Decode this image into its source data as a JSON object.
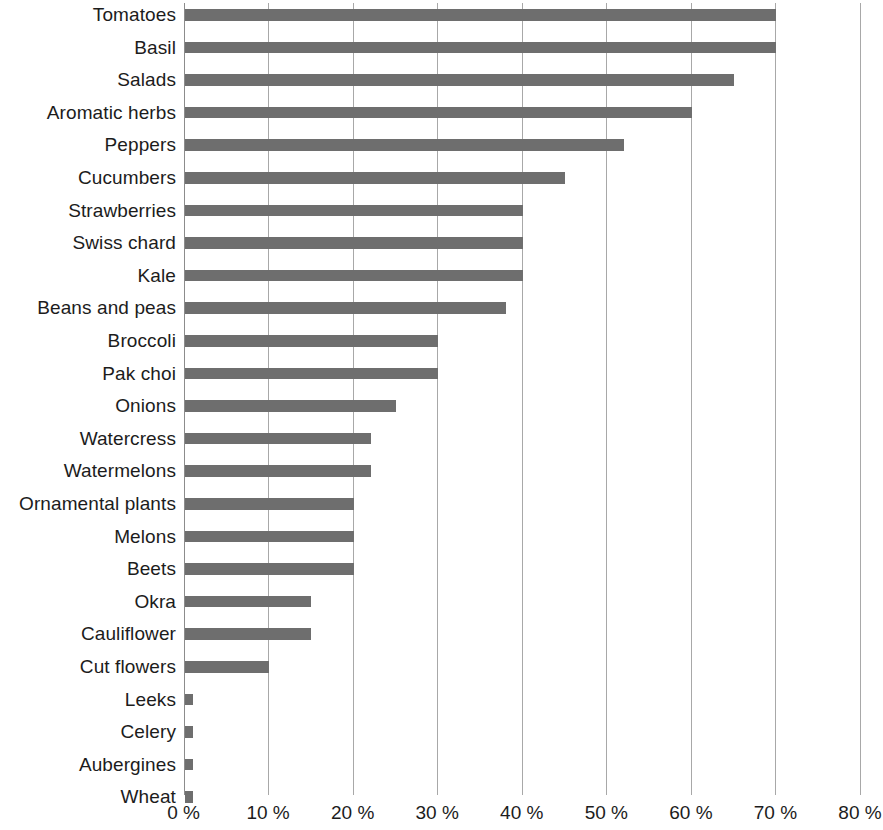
{
  "chart_data": {
    "type": "bar",
    "orientation": "horizontal",
    "title": "",
    "subtitle": "",
    "xlabel": "",
    "ylabel": "",
    "xlim": [
      0,
      80
    ],
    "xticks": [
      0,
      10,
      20,
      30,
      40,
      50,
      60,
      70,
      80
    ],
    "xtick_labels": [
      "0 %",
      "10 %",
      "20 %",
      "30 %",
      "40 %",
      "50 %",
      "60 %",
      "70 %",
      "80 %"
    ],
    "grid": "vertical",
    "legend": null,
    "bar_color": "#6e6e6e",
    "gridline_color": "#a8a8a8",
    "background_color": "#ffffff",
    "categories": [
      "Tomatoes",
      "Basil",
      "Salads",
      "Aromatic herbs",
      "Peppers",
      "Cucumbers",
      "Strawberries",
      "Swiss chard",
      "Kale",
      "Beans and peas",
      "Broccoli",
      "Pak choi",
      "Onions",
      "Watercress",
      "Watermelons",
      "Ornamental plants",
      "Melons",
      "Beets",
      "Okra",
      "Cauliflower",
      "Cut flowers",
      "Leeks",
      "Celery",
      "Aubergines",
      "Wheat"
    ],
    "values": [
      70,
      70,
      65,
      60,
      52,
      45,
      40,
      40,
      40,
      38,
      30,
      30,
      25,
      22,
      22,
      20,
      20,
      20,
      15,
      15,
      10,
      1,
      1,
      1,
      1
    ]
  }
}
